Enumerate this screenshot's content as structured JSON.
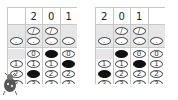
{
  "grids": [
    {
      "name": "left-answer-grid",
      "header": [
        "",
        "2",
        "0",
        "1"
      ],
      "slash_row": [
        false,
        true,
        true,
        false
      ],
      "dot_row": [
        true,
        true,
        true,
        true
      ],
      "digit_rows": [
        "0",
        "1",
        "2",
        "3"
      ],
      "has_zero": [
        false,
        true,
        true,
        true
      ],
      "filled": {
        "0": 2,
        "1": 3,
        "2": 1
      }
    },
    {
      "name": "right-answer-grid",
      "header": [
        "2",
        "0",
        "1",
        ""
      ],
      "slash_row": [
        false,
        true,
        true,
        false
      ],
      "dot_row": [
        true,
        true,
        true,
        true
      ],
      "digit_rows": [
        "0",
        "1",
        "2",
        "3"
      ],
      "has_zero": [
        false,
        true,
        true,
        true
      ],
      "filled": {
        "2": 0,
        "0": 1,
        "1": 2
      }
    }
  ],
  "symbols": {
    "slash": "/",
    "dot": "."
  },
  "colors": {
    "grid_line": "#c8c8c8",
    "shade": "#e6e6e6",
    "fill": "#111111"
  }
}
